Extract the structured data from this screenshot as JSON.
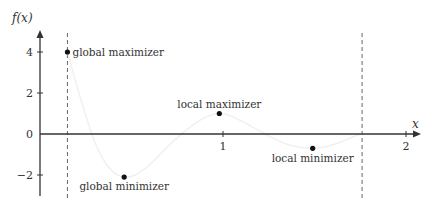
{
  "chart_data": {
    "type": "line",
    "title": "",
    "xlabel": "x",
    "ylabel": "f(x)",
    "xlim": [
      0,
      2.1
    ],
    "ylim": [
      -3,
      5
    ],
    "x_ticks": [
      {
        "value": 1,
        "label": "1"
      },
      {
        "value": 2,
        "label": "2"
      }
    ],
    "y_ticks": [
      {
        "value": 4,
        "label": "4"
      },
      {
        "value": 2,
        "label": "2"
      },
      {
        "value": 0,
        "label": "0"
      },
      {
        "value": -2,
        "label": "−2"
      }
    ],
    "grid": false,
    "domain_bounds": [
      0.15,
      1.76
    ],
    "curve": {
      "x": [
        0.15,
        0.2,
        0.25,
        0.3,
        0.35,
        0.4,
        0.46,
        0.52,
        0.6,
        0.7,
        0.8,
        0.9,
        0.98,
        1.05,
        1.15,
        1.25,
        1.35,
        1.42,
        1.49,
        1.56,
        1.64,
        1.72,
        1.76
      ],
      "y": [
        4.0,
        2.4,
        0.9,
        -0.4,
        -1.3,
        -1.85,
        -2.1,
        -2.0,
        -1.5,
        -0.6,
        0.2,
        0.8,
        1.0,
        0.85,
        0.4,
        -0.1,
        -0.5,
        -0.65,
        -0.7,
        -0.62,
        -0.4,
        -0.1,
        0.0
      ]
    },
    "points": [
      {
        "x": 0.15,
        "y": 4.0,
        "label": "global maximizer"
      },
      {
        "x": 0.46,
        "y": -2.1,
        "label": "global minimizer"
      },
      {
        "x": 0.98,
        "y": 1.0,
        "label": "local maximizer"
      },
      {
        "x": 1.49,
        "y": -0.7,
        "label": "local minimizer"
      }
    ]
  },
  "axes": {
    "y_title": "f(x)",
    "x_title": "x"
  }
}
